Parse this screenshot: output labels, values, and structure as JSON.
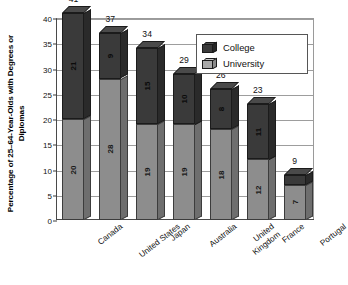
{
  "chart_data": {
    "type": "bar",
    "subtype": "stacked-3d-column",
    "title": "",
    "xlabel": "",
    "ylabel": "Percentage of 25–64-Year-Olds with Degrees or Diplomas",
    "ylim": [
      0,
      40
    ],
    "ytick_step": 5,
    "yticks": [
      "0",
      "5",
      "10",
      "15",
      "20",
      "25",
      "30",
      "35",
      "40"
    ],
    "grid": true,
    "legend_position": "top-right",
    "categories": [
      "Canada",
      "United States",
      "Japan",
      "Australia",
      "United Kingdom",
      "France",
      "Portugal"
    ],
    "category_lines": [
      [
        "Canada"
      ],
      [
        "United States"
      ],
      [
        "Japan"
      ],
      [
        "Australia"
      ],
      [
        "United",
        "Kingdom"
      ],
      [
        "France"
      ],
      [
        "Portugal"
      ]
    ],
    "series": [
      {
        "name": "University",
        "color": "#8d8d8d",
        "values": [
          20,
          28,
          19,
          19,
          18,
          12,
          7
        ]
      },
      {
        "name": "College",
        "color": "#3a3a3a",
        "values": [
          21,
          9,
          15,
          10,
          8,
          11,
          2
        ]
      }
    ],
    "totals": [
      41,
      37,
      34,
      29,
      26,
      23,
      9
    ]
  },
  "legend": {
    "items": [
      {
        "label": "College",
        "key": "college"
      },
      {
        "label": "University",
        "key": "university"
      }
    ]
  }
}
